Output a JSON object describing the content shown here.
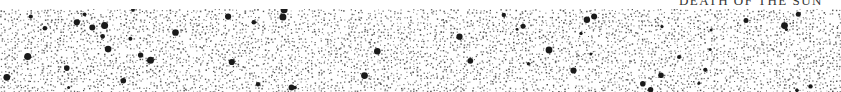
{
  "page": {
    "running_header": "DEATH OF THE SUN"
  },
  "illustration": {
    "description": "stippled star field",
    "dot_color": "#3a3a3a",
    "bright_star_color": "#1a1a1a",
    "background": "#ffffff"
  }
}
